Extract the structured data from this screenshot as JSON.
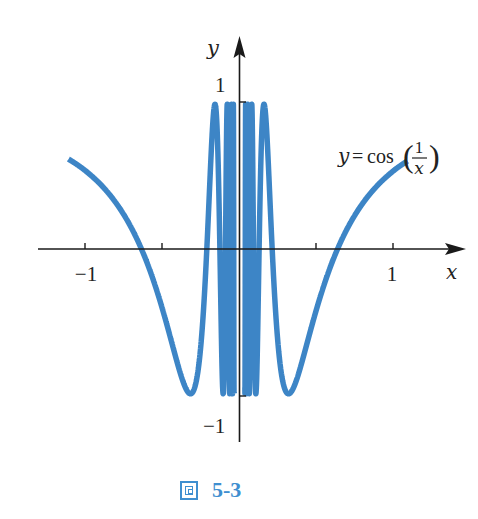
{
  "chart_data": {
    "type": "line",
    "function": "y = cos(1/x)",
    "title": "",
    "series": [
      {
        "name": "y = cos(1/x)",
        "x_range": [
          -1.11,
          1.09
        ],
        "color": "#3d85c6"
      }
    ],
    "xlabel": "x",
    "ylabel": "y",
    "xlim": [
      -1.3,
      1.4
    ],
    "ylim": [
      -1.2,
      1.3
    ],
    "x_ticks": [
      -1,
      -0.5,
      0.5,
      1
    ],
    "x_tick_labels": [
      "-1",
      "",
      "",
      "1"
    ],
    "y_ticks": [
      1,
      -1
    ],
    "y_tick_labels": [
      "1",
      "−1"
    ],
    "sample_points": [
      {
        "x": -1.11,
        "y": 0.62
      },
      {
        "x": -1.0,
        "y": 0.54
      },
      {
        "x": -0.6366,
        "y": 0.0
      },
      {
        "x": -0.3183,
        "y": -1.0
      },
      {
        "x": -0.2122,
        "y": 0.0
      },
      {
        "x": -0.1592,
        "y": 1.0
      },
      {
        "x": 0.1592,
        "y": 1.0
      },
      {
        "x": 0.2122,
        "y": 0.0
      },
      {
        "x": 0.3183,
        "y": -1.0
      },
      {
        "x": 0.6366,
        "y": 0.0
      },
      {
        "x": 1.0,
        "y": 0.54
      },
      {
        "x": 1.09,
        "y": 0.61
      }
    ],
    "annotations": [
      "y = cos(1/x)"
    ],
    "grid": false,
    "legend": "none"
  },
  "labels": {
    "y_axis": "y",
    "x_axis": "x",
    "y_tick_pos": "1",
    "y_tick_neg": "−1",
    "x_tick_neg": "−1",
    "x_tick_pos": "1",
    "equation_lhs": "y",
    "equation_eq": "=",
    "equation_fn": "cos",
    "equation_num": "1",
    "equation_den": "x"
  },
  "caption": {
    "icon": "figure-icon",
    "label": "5-3"
  },
  "geometry": {
    "origin_px": [
      239.5,
      249
    ],
    "x_scale": 154,
    "y_scale": 147,
    "stroke_width": 5.5,
    "axis_color": "#1a1a1a"
  }
}
